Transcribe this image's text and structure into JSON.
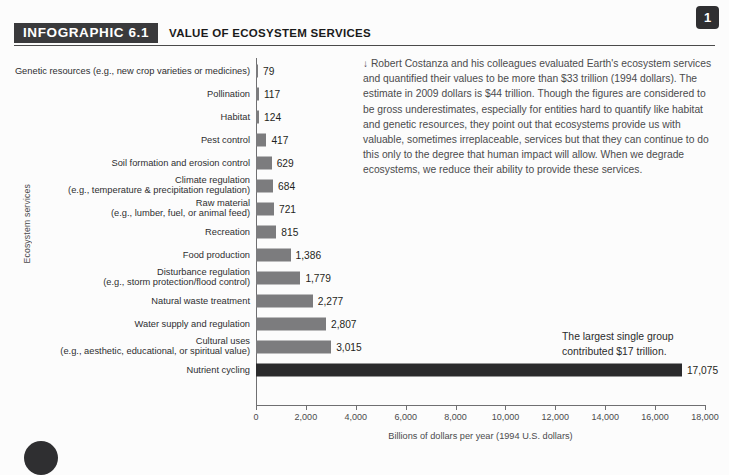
{
  "header": {
    "badge": "INFOGRAPHIC 6.1",
    "title": "VALUE OF ECOSYSTEM SERVICES"
  },
  "page_badge": "1",
  "note": {
    "arrow": "↓",
    "text": "Robert Costanza and his colleagues evaluated Earth's ecosystem services and quantified their values to be more than $33 trillion (1994 dollars). The estimate in 2009 dollars is $44 trillion. Though the figures are considered to be gross underestimates, especially for entities hard to quantify like habitat and genetic resources, they point out that ecosystems provide us with valuable, sometimes irreplaceable, services but that they can continue to do this only to the degree that human impact will allow. When we degrade ecosystems, we reduce their ability to provide these services."
  },
  "callout": {
    "text": "The largest single group contributed $17 trillion."
  },
  "chart_data": {
    "type": "bar",
    "orientation": "horizontal",
    "title": "VALUE OF ECOSYSTEM SERVICES",
    "xlabel": "Billions of dollars per year (1994 U.S. dollars)",
    "ylabel": "Ecosystem services",
    "xlim": [
      0,
      18000
    ],
    "xticks": [
      0,
      2000,
      4000,
      6000,
      8000,
      10000,
      12000,
      14000,
      16000,
      18000
    ],
    "xtick_labels": [
      "0",
      "2,000",
      "4,000",
      "6,000",
      "8,000",
      "10,000",
      "12,000",
      "14,000",
      "16,000",
      "18,000"
    ],
    "grid": false,
    "legend": "none",
    "bar_color": "#7c7c7e",
    "highlight_color": "#2a2a2c",
    "categories": [
      "Genetic resources (e.g., new crop varieties or medicines)",
      "Pollination",
      "Habitat",
      "Pest control",
      "Soil formation and erosion control",
      "Climate regulation (e.g., temperature & precipitation regulation)",
      "Raw material (e.g., lumber, fuel, or animal feed)",
      "Recreation",
      "Food production",
      "Disturbance regulation (e.g., storm protection/flood control)",
      "Natural waste treatment",
      "Water supply and regulation",
      "Cultural uses (e.g., aesthetic, educational, or spiritual value)",
      "Nutrient cycling"
    ],
    "values": [
      79,
      117,
      124,
      417,
      629,
      684,
      721,
      815,
      1386,
      1779,
      2277,
      2807,
      3015,
      17075
    ],
    "value_labels": [
      "79",
      "117",
      "124",
      "417",
      "629",
      "684",
      "721",
      "815",
      "1,386",
      "1,779",
      "2,277",
      "2,807",
      "3,015",
      "17,075"
    ]
  },
  "rows": [
    {
      "line1": "Genetic resources (e.g., new crop varieties or medicines)",
      "line2": "",
      "value": 79,
      "label": "79",
      "highlight": false
    },
    {
      "line1": "Pollination",
      "line2": "",
      "value": 117,
      "label": "117",
      "highlight": false
    },
    {
      "line1": "Habitat",
      "line2": "",
      "value": 124,
      "label": "124",
      "highlight": false
    },
    {
      "line1": "Pest control",
      "line2": "",
      "value": 417,
      "label": "417",
      "highlight": false
    },
    {
      "line1": "Soil formation and erosion control",
      "line2": "",
      "value": 629,
      "label": "629",
      "highlight": false
    },
    {
      "line1": "Climate regulation",
      "line2": "(e.g., temperature & precipitation regulation)",
      "value": 684,
      "label": "684",
      "highlight": false
    },
    {
      "line1": "Raw material",
      "line2": "(e.g., lumber, fuel, or animal feed)",
      "value": 721,
      "label": "721",
      "highlight": false
    },
    {
      "line1": "Recreation",
      "line2": "",
      "value": 815,
      "label": "815",
      "highlight": false
    },
    {
      "line1": "Food production",
      "line2": "",
      "value": 1386,
      "label": "1,386",
      "highlight": false
    },
    {
      "line1": "Disturbance regulation",
      "line2": "(e.g., storm protection/flood control)",
      "value": 1779,
      "label": "1,779",
      "highlight": false
    },
    {
      "line1": "Natural waste treatment",
      "line2": "",
      "value": 2277,
      "label": "2,277",
      "highlight": false
    },
    {
      "line1": "Water supply and regulation",
      "line2": "",
      "value": 2807,
      "label": "2,807",
      "highlight": false
    },
    {
      "line1": "Cultural uses",
      "line2": "(e.g., aesthetic, educational, or spiritual value)",
      "value": 3015,
      "label": "3,015",
      "highlight": false
    },
    {
      "line1": "Nutrient cycling",
      "line2": "",
      "value": 17075,
      "label": "17,075",
      "highlight": true
    }
  ]
}
